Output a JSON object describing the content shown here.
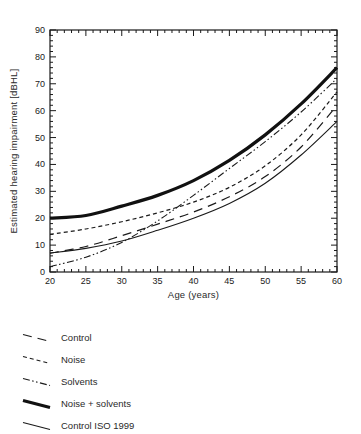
{
  "figure": {
    "background": "#ffffff",
    "ink_color": "#1a1a1a",
    "text_color": "#2a2a2a"
  },
  "chart_data": {
    "type": "line",
    "title": "",
    "xlabel": "Age (years)",
    "ylabel": "Estimated hearing impairment [dBHL]",
    "xlim": [
      20,
      60
    ],
    "ylim": [
      0,
      90
    ],
    "x_ticks": [
      20,
      25,
      30,
      35,
      40,
      45,
      50,
      55,
      60
    ],
    "y_ticks": [
      0,
      10,
      20,
      30,
      40,
      50,
      60,
      70,
      80,
      90
    ],
    "x_minor_step": 1,
    "y_minor_step": 2,
    "grid": "off",
    "box": "full-frame-inward-ticks",
    "legend_position": "below-left",
    "x": [
      20,
      25,
      30,
      35,
      40,
      45,
      50,
      55,
      60
    ],
    "series": [
      {
        "name": "Control",
        "style": "long-dash",
        "color": "#1a1a1a",
        "width": 1.2,
        "dash": "9 6",
        "values": [
          7,
          9.5,
          13.5,
          17.8,
          22.3,
          28,
          35.5,
          46.5,
          62
        ]
      },
      {
        "name": "Noise",
        "style": "short-dash",
        "color": "#1a1a1a",
        "width": 1.2,
        "dash": "4 3",
        "values": [
          14,
          16,
          18.7,
          22,
          26,
          31.5,
          39.5,
          51,
          67
        ]
      },
      {
        "name": "Solvents",
        "style": "dash-dot-dot",
        "color": "#1a1a1a",
        "width": 1.1,
        "dash": "7 2.5 1.5 2.5 1.5 2.5",
        "values": [
          2,
          5.5,
          11,
          19,
          28.5,
          38.5,
          48.5,
          59.5,
          72
        ]
      },
      {
        "name": "Noise + solvents",
        "style": "thick-solid",
        "color": "#111111",
        "width": 3.2,
        "dash": "",
        "values": [
          20,
          21,
          24.5,
          28.5,
          34,
          41.5,
          51,
          62.5,
          76
        ]
      },
      {
        "name": "Control ISO 1999",
        "style": "thin-solid",
        "color": "#1a1a1a",
        "width": 1.1,
        "dash": "",
        "values": [
          7,
          8.8,
          11.5,
          15.5,
          20,
          25.5,
          33,
          43.5,
          56
        ]
      }
    ]
  }
}
